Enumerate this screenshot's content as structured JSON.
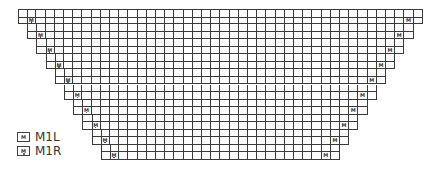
{
  "diagram": {
    "type": "knitting-chart",
    "columns": 44,
    "rows": 20,
    "rows_per_step": 2,
    "steps": 10,
    "grid_origin": {
      "x": 18,
      "y": 9
    },
    "cell_size": {
      "w": 9.2,
      "h": 7.55
    },
    "line_color": "#3a3a3a",
    "marker_text": "M",
    "left_marker_symbol": "M1R",
    "right_marker_symbol": "M1L"
  },
  "legend": {
    "items": [
      {
        "symbol": "M",
        "dot": false,
        "label": "M1L"
      },
      {
        "symbol": "M",
        "dot": true,
        "label": "M1R"
      }
    ]
  }
}
